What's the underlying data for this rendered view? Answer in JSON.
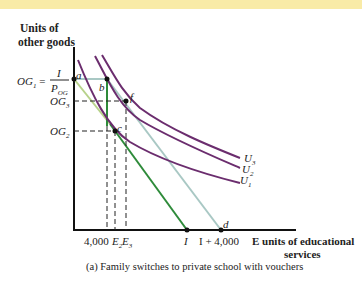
{
  "banner": {
    "color": "#f9eba7"
  },
  "y_axis": {
    "title_line1": "Units of",
    "title_line2": "other goods"
  },
  "x_axis": {
    "title_line1": "E units of educational",
    "title_line2": "services"
  },
  "y_ticks": {
    "og1_lhs": "OG",
    "og1_sub": "1",
    "og1_eq": "=",
    "og1_num": "I",
    "og1_den": "P",
    "og1_den_sub": "OG",
    "og3": "OG",
    "og3_sub": "3",
    "og2": "OG",
    "og2_sub": "2"
  },
  "x_ticks": {
    "t4000": "4,000",
    "e2": "E",
    "e2_sub": "2",
    "e3": "E",
    "e3_sub": "3",
    "i": "I",
    "i_plus": "I + 4,000"
  },
  "points": {
    "a": "a",
    "b": "b",
    "c": "c",
    "f": "f",
    "d": "d"
  },
  "curves": {
    "u1": "U",
    "u1_sub": "1",
    "u2": "U",
    "u2_sub": "2",
    "u3": "U",
    "u3_sub": "3"
  },
  "caption": "(a) Family switches to private school with vouchers",
  "colors": {
    "budget_original": "#2e8b3a",
    "budget_original_light": "#b7d28a",
    "budget_voucher": "#a9c8c4",
    "indifference": "#6b2d6e",
    "axis": "#111111"
  }
}
